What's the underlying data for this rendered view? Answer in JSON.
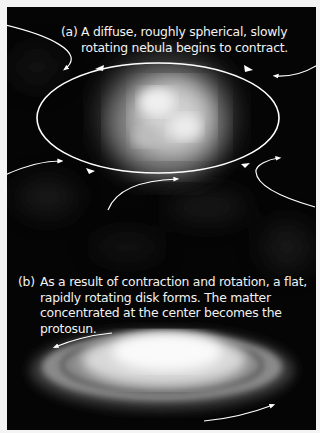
{
  "figure": {
    "panel_a": {
      "label": "(a)",
      "caption": "A diffuse, roughly spherical, slowly rotating nebula begins to contract."
    },
    "panel_b": {
      "label": "(b)",
      "caption": "As a result of contraction and rotation, a flat, rapidly rotating disk forms. The matter concentrated at the center becomes the protosun."
    },
    "colors": {
      "background": "#050505",
      "border": "#f4f4f4",
      "text": "#f2f2f2",
      "arrows": "#ffffff"
    }
  }
}
